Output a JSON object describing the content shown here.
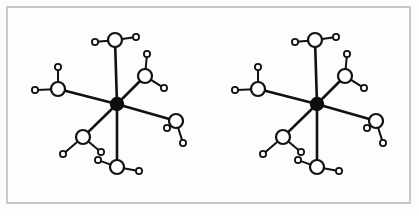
{
  "figure": {
    "kind": "molecular-structure-diagram",
    "caption": "",
    "title": "",
    "panel_count": 2,
    "background_color": "#fdfdfd",
    "frame": {
      "label": "figure-border",
      "color": "#c9c9c9",
      "stroke_width": 2,
      "x": 7,
      "y": 7,
      "width": 403,
      "height": 196
    },
    "style": {
      "bond_color": "#111111",
      "metal_color": "#0d0d0d",
      "atom_outline_color": "#111111",
      "atom_fill_color": "#ffffff",
      "metal_bond_width": 2.6,
      "oh_bond_width": 2.0,
      "metal_radius": 7.2,
      "oxygen_radius": 7.0,
      "hydrogen_radius": 3.1,
      "oxygen_stroke": 2.2,
      "hydrogen_stroke": 1.8
    },
    "atom_legend": {
      "metal": "filled black circle (central metal cation)",
      "oxygen": "large open circle (water oxygen)",
      "hydrogen": "small open circle (water hydrogen)"
    },
    "panels": [
      {
        "name": "left-complex",
        "center": {
          "label": "metal-center",
          "x": 117,
          "y": 104
        },
        "ligands": [
          {
            "name": "water-top",
            "o": {
              "x": 115,
              "y": 40
            },
            "h": [
              {
                "x": 95,
                "y": 42
              },
              {
                "x": 136,
                "y": 37
              }
            ]
          },
          {
            "name": "water-upper-left",
            "o": {
              "x": 58,
              "y": 89
            },
            "h": [
              {
                "x": 35,
                "y": 90
              },
              {
                "x": 58,
                "y": 67
              }
            ]
          },
          {
            "name": "water-upper-right",
            "o": {
              "x": 145,
              "y": 76
            },
            "h": [
              {
                "x": 147,
                "y": 54
              },
              {
                "x": 164,
                "y": 88
              }
            ]
          },
          {
            "name": "water-right",
            "o": {
              "x": 176,
              "y": 121
            },
            "h": [
              {
                "x": 167,
                "y": 128
              },
              {
                "x": 183,
                "y": 143
              }
            ]
          },
          {
            "name": "water-lower-left",
            "o": {
              "x": 83,
              "y": 137
            },
            "h": [
              {
                "x": 63,
                "y": 154
              },
              {
                "x": 101,
                "y": 152
              }
            ]
          },
          {
            "name": "water-bottom",
            "o": {
              "x": 117,
              "y": 167
            },
            "h": [
              {
                "x": 98,
                "y": 160
              },
              {
                "x": 139,
                "y": 171
              }
            ]
          }
        ]
      },
      {
        "name": "right-complex",
        "center": {
          "label": "metal-center",
          "x": 317,
          "y": 104
        },
        "ligands": [
          {
            "name": "water-top",
            "o": {
              "x": 315,
              "y": 40
            },
            "h": [
              {
                "x": 295,
                "y": 42
              },
              {
                "x": 336,
                "y": 37
              }
            ]
          },
          {
            "name": "water-upper-left",
            "o": {
              "x": 258,
              "y": 89
            },
            "h": [
              {
                "x": 235,
                "y": 90
              },
              {
                "x": 258,
                "y": 67
              }
            ]
          },
          {
            "name": "water-upper-right",
            "o": {
              "x": 345,
              "y": 76
            },
            "h": [
              {
                "x": 347,
                "y": 54
              },
              {
                "x": 364,
                "y": 88
              }
            ]
          },
          {
            "name": "water-right",
            "o": {
              "x": 376,
              "y": 121
            },
            "h": [
              {
                "x": 367,
                "y": 128
              },
              {
                "x": 383,
                "y": 143
              }
            ]
          },
          {
            "name": "water-lower-left",
            "o": {
              "x": 283,
              "y": 137
            },
            "h": [
              {
                "x": 263,
                "y": 154
              },
              {
                "x": 301,
                "y": 152
              }
            ]
          },
          {
            "name": "water-bottom",
            "o": {
              "x": 317,
              "y": 167
            },
            "h": [
              {
                "x": 298,
                "y": 160
              },
              {
                "x": 339,
                "y": 171
              }
            ]
          }
        ]
      }
    ],
    "alt_text": "Two identical octahedral hexaaqua complexes side by side; each has a filled black central metal atom bonded to six open-circle water oxygens, each oxygen carrying two small open-circle hydrogens."
  }
}
